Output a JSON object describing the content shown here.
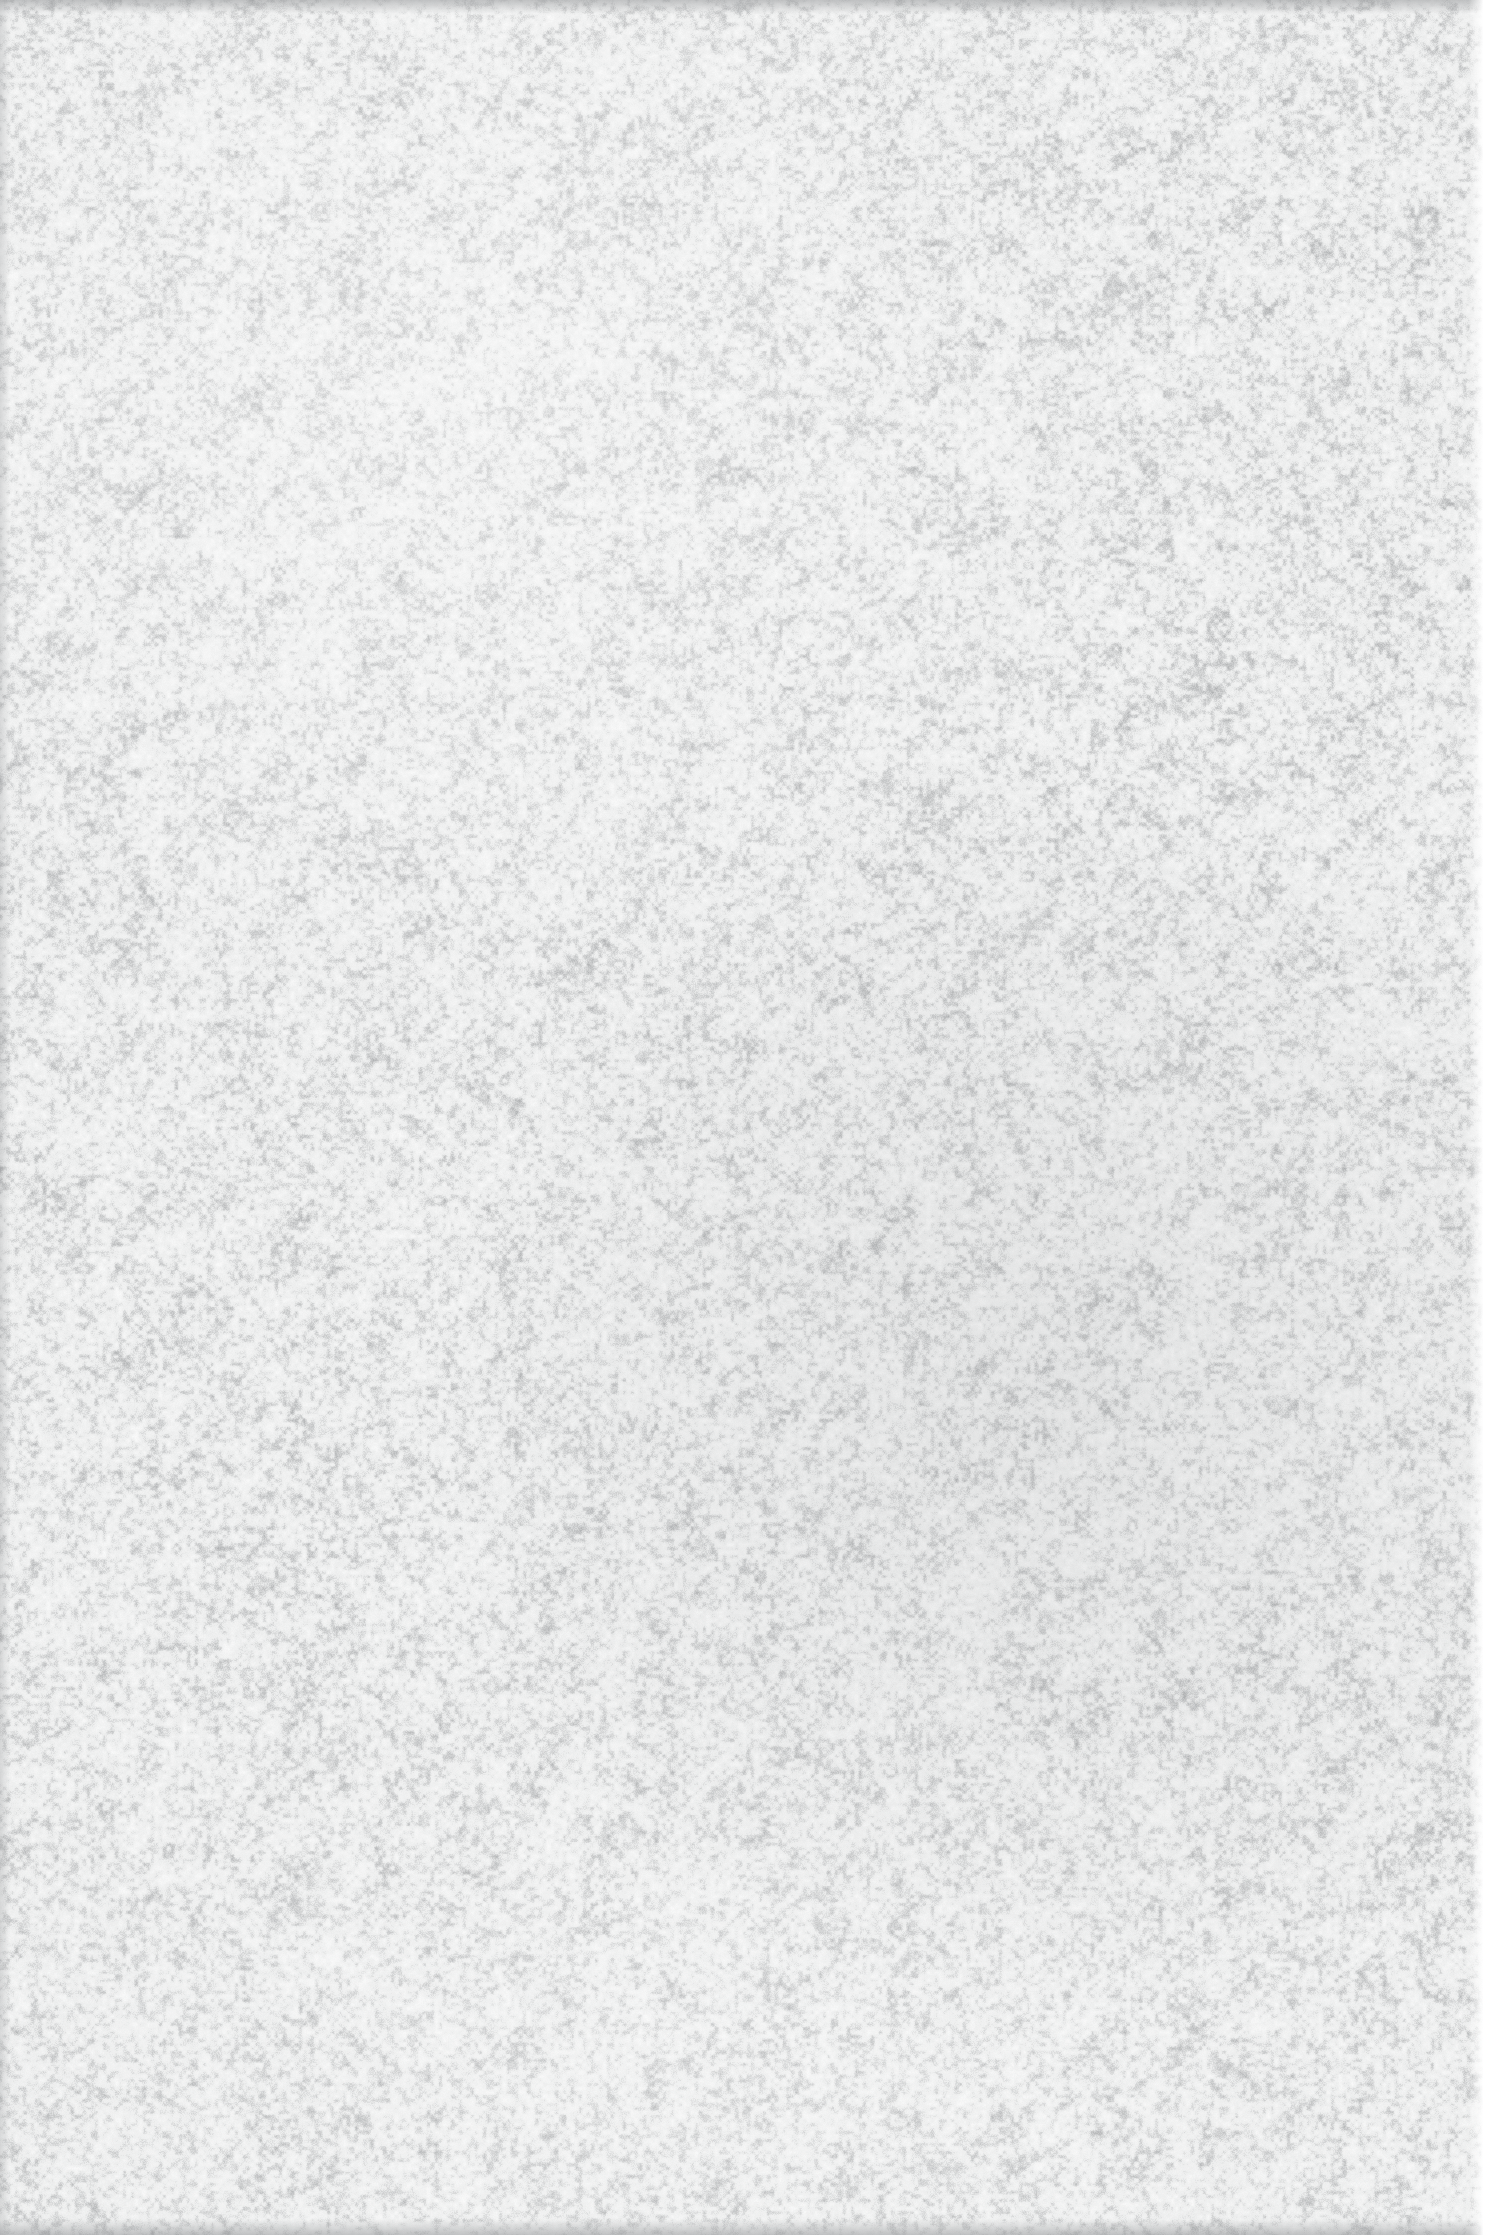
{
  "image": {
    "kind": "noise-texture",
    "description": "Full-bleed monochrome granular noise field resembling film grain or scanned paper fibre",
    "width": 1507,
    "height": 2235,
    "colors": {
      "base": "#eceded",
      "grain_light": "#ffffff",
      "grain_mid": "#d8dada",
      "grain_dark": "#9a9c9e",
      "margin": "#ffffff",
      "vignette": "#96989a"
    },
    "grain": {
      "feature_size_px": 4,
      "contrast": "low",
      "saturation": "none",
      "distribution": "uniform"
    },
    "regions": {
      "grain_field": {
        "x": 0,
        "y": 0,
        "width": 1483,
        "height": 2235
      },
      "right_margin": {
        "x": 1483,
        "y": 0,
        "width": 24,
        "height": 2235
      },
      "top_vignette_height": 14,
      "bottom_vignette_height": 16,
      "left_vignette_width": 10
    }
  }
}
